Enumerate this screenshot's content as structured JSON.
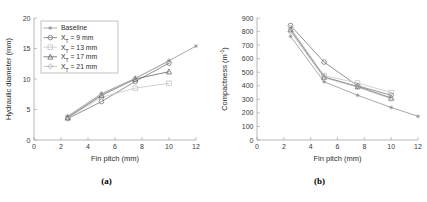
{
  "figure": {
    "panels": [
      {
        "sublabel": "(a)"
      },
      {
        "sublabel": "(b)"
      }
    ]
  },
  "legend": {
    "entries": [
      {
        "label": "Baseline",
        "marker": "star-marker",
        "color": "#8d8d8d"
      },
      {
        "label": "X_T = 9 mm",
        "marker": "circle-marker",
        "color": "#6f6f6f"
      },
      {
        "label": "X_T = 13 mm",
        "marker": "square-marker",
        "color": "#c2c2c2"
      },
      {
        "label": "X_T = 17 mm",
        "marker": "triangle-marker",
        "color": "#5c5c5c"
      },
      {
        "label": "X_T = 21 mm",
        "marker": "diamond-marker",
        "color": "#b0b0b0"
      }
    ],
    "entry_text": [
      {
        "pre": "Baseline",
        "base": "",
        "sub": "",
        "post": ""
      },
      {
        "pre": "X",
        "sub": "T",
        "post": " = 9 mm"
      },
      {
        "pre": "X",
        "sub": "T",
        "post": " = 13 mm"
      },
      {
        "pre": "X",
        "sub": "T",
        "post": " = 17 mm"
      },
      {
        "pre": "X",
        "sub": "T",
        "post": " = 21 mm"
      }
    ]
  },
  "chart_data": [
    {
      "type": "line",
      "panel": "(a)",
      "title": "",
      "xlabel": "Fin pitch (mm)",
      "ylabel": "Hydraulic diameter (mm)",
      "xlim": [
        0,
        12
      ],
      "ylim": [
        0,
        20
      ],
      "xticks": [
        0,
        2,
        4,
        6,
        8,
        10,
        12
      ],
      "yticks": [
        0,
        5,
        10,
        15,
        20
      ],
      "xtick_labels": [
        "0",
        "2",
        "4",
        "6",
        "8",
        "10",
        "12"
      ],
      "ytick_labels": [
        "0",
        "5",
        "10",
        "15",
        "20"
      ],
      "grid": false,
      "legend_position": "upper-left",
      "series": [
        {
          "name": "Baseline",
          "marker": "star-marker",
          "color": "#8d8d8d",
          "x": [
            2.5,
            5.0,
            7.5,
            10.0,
            12.0
          ],
          "y": [
            3.9,
            7.6,
            10.1,
            13.0,
            15.4
          ]
        },
        {
          "name": "X_T = 9 mm",
          "marker": "circle-marker",
          "color": "#6f6f6f",
          "x": [
            2.5,
            5.0,
            7.5,
            10.0
          ],
          "y": [
            3.5,
            6.3,
            9.6,
            12.6
          ]
        },
        {
          "name": "X_T = 13 mm",
          "marker": "square-marker",
          "color": "#c2c2c2",
          "x": [
            2.5,
            5.0,
            7.5,
            10.0
          ],
          "y": [
            3.6,
            7.0,
            8.5,
            9.3
          ]
        },
        {
          "name": "X_T = 17 mm",
          "marker": "triangle-marker",
          "color": "#5c5c5c",
          "x": [
            2.5,
            5.0,
            7.5,
            10.0
          ],
          "y": [
            3.7,
            7.3,
            10.0,
            11.2
          ]
        },
        {
          "name": "X_T = 21 mm",
          "marker": "diamond-marker",
          "color": "#b0b0b0",
          "x": [
            2.5,
            5.0,
            7.5,
            10.0
          ],
          "y": [
            3.8,
            7.5,
            10.1,
            12.9
          ]
        }
      ]
    },
    {
      "type": "line",
      "panel": "(b)",
      "title": "",
      "xlabel": "Fin pitch (mm)",
      "ylabel": "Compactness (m-1)",
      "ylabel_unit_base": "m",
      "ylabel_unit_exp": "-1",
      "xlim": [
        0,
        12
      ],
      "ylim": [
        0,
        900
      ],
      "xticks": [
        0,
        2,
        4,
        6,
        8,
        10,
        12
      ],
      "yticks": [
        0,
        100,
        200,
        300,
        400,
        500,
        600,
        700,
        800,
        900
      ],
      "xtick_labels": [
        "0",
        "2",
        "4",
        "6",
        "8",
        "10",
        "12"
      ],
      "ytick_labels": [
        "0",
        "100",
        "200",
        "300",
        "400",
        "500",
        "600",
        "700",
        "800",
        "900"
      ],
      "grid": false,
      "legend_position": "none",
      "series": [
        {
          "name": "Baseline",
          "marker": "star-marker",
          "color": "#8d8d8d",
          "x": [
            2.5,
            5.0,
            7.5,
            10.0,
            12.0
          ],
          "y": [
            765,
            430,
            330,
            240,
            175
          ]
        },
        {
          "name": "X_T = 9 mm",
          "marker": "circle-marker",
          "color": "#6f6f6f",
          "x": [
            2.5,
            5.0,
            7.5,
            10.0
          ],
          "y": [
            845,
            575,
            400,
            330
          ]
        },
        {
          "name": "X_T = 13 mm",
          "marker": "square-marker",
          "color": "#c2c2c2",
          "x": [
            2.5,
            5.0,
            7.5,
            10.0
          ],
          "y": [
            828,
            475,
            420,
            350
          ]
        },
        {
          "name": "X_T = 17 mm",
          "marker": "triangle-marker",
          "color": "#5c5c5c",
          "x": [
            2.5,
            5.0,
            7.5,
            10.0
          ],
          "y": [
            815,
            465,
            395,
            310
          ]
        },
        {
          "name": "X_T = 21 mm",
          "marker": "diamond-marker",
          "color": "#b0b0b0",
          "x": [
            2.5,
            5.0,
            7.5,
            10.0
          ],
          "y": [
            800,
            460,
            390,
            305
          ]
        }
      ]
    }
  ]
}
